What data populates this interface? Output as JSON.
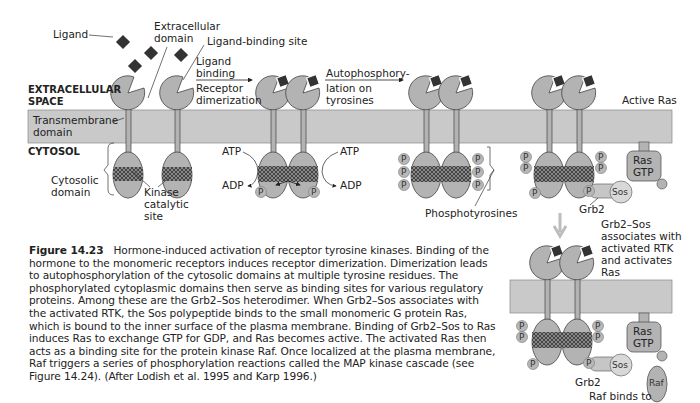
{
  "labels": {
    "ligand": "Ligand",
    "extracellular_domain_1": "Extracellular",
    "extracellular_domain_2": "domain",
    "ligand_binding_site": "Ligand-binding site",
    "ligand_binding_1": "Ligand",
    "ligand_binding_2": "binding",
    "receptor_dimerization_1": "Receptor",
    "receptor_dimerization_2": "dimerization",
    "autophos_1": "Autophosphory-",
    "autophos_2": "lation on",
    "autophos_3": "tyrosines",
    "extracellular_space_1": "EXTRACELLULAR",
    "extracellular_space_2": "SPACE",
    "transmembrane_1": "Transmembrane",
    "transmembrane_2": "domain",
    "cytosol": "CYTOSOL",
    "cytosolic_domain_1": "Cytosolic",
    "cytosolic_domain_2": "domain",
    "kinase_1": "Kinase",
    "kinase_2": "catalytic",
    "kinase_3": "site",
    "atp": "ATP",
    "adp": "ADP",
    "p": "P",
    "phosphotyrosines": "Phosphotyrosines",
    "active_ras": "Active Ras",
    "ras": "Ras",
    "gtp": "GTP",
    "sos": "Sos",
    "grb2": "Grb2",
    "raf": "Raf",
    "grb2sos_1": "Grb2–Sos",
    "grb2sos_2": "associates with",
    "grb2sos_3": "activated RTK",
    "grb2sos_4": "and activates",
    "grb2sos_5": "Ras",
    "raf_binds": "Raf binds to"
  },
  "caption": {
    "figure_number": "Figure 14.23",
    "text": "Hormone-induced activation of receptor tyrosine kinases. Binding of the hormone to the monomeric receptors induces receptor dimerization. Dimerization leads to autophosphorylation of the cytosolic domains at multiple tyrosine residues. The phosphorylated cytoplasmic domains then serve as binding sites for various regulatory proteins. Among these are the Grb2–Sos heterodimer. When Grb2–Sos associates with the activated RTK, the Sos polypeptide binds to the small monomeric G protein Ras, which is bound to the inner surface of the plasma membrane. Binding of Grb2–Sos to Ras induces Ras to exchange GTP for GDP, and Ras becomes active. The activated Ras then acts as a binding site for the protein kinase Raf. Once localized at the plasma membrane, Raf triggers a series of phosphorylation reactions called the MAP kinase cascade (see Figure 14.24). (After Lodish et al. 1995 and Karp 1996.)"
  },
  "colors": {
    "membrane": "#c9c9c9",
    "protein": "#b3b3b3",
    "ligand": "#333333",
    "arrow": "#bdbdbd"
  }
}
